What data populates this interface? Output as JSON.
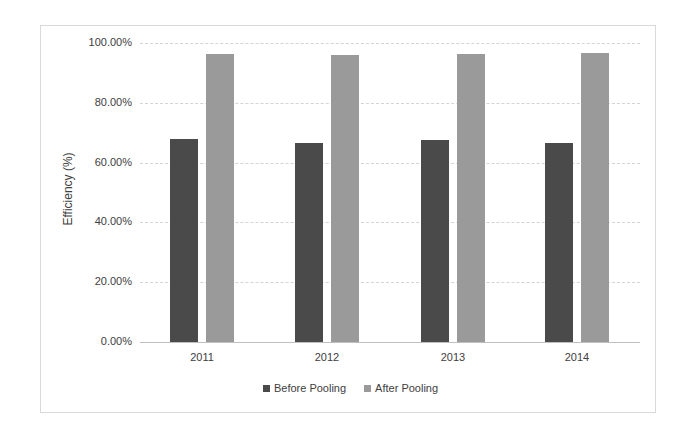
{
  "chart_data": {
    "type": "bar",
    "title": "",
    "xlabel": "",
    "ylabel": "Efficiency (%)",
    "ylim": [
      0,
      100
    ],
    "yticks": [
      "0.00%",
      "20.00%",
      "40.00%",
      "60.00%",
      "80.00%",
      "100.00%"
    ],
    "categories": [
      "2011",
      "2012",
      "2013",
      "2014"
    ],
    "series": [
      {
        "name": "Before Pooling",
        "color": "#4a4a4a",
        "values": [
          68.0,
          66.4,
          67.7,
          66.4
        ]
      },
      {
        "name": "After Pooling",
        "color": "#9a9a9a",
        "values": [
          96.2,
          95.9,
          96.4,
          96.6
        ]
      }
    ],
    "grid": true,
    "legend_position": "bottom"
  },
  "legend": {
    "items": [
      {
        "label": "Before Pooling",
        "color": "#4a4a4a"
      },
      {
        "label": "After Pooling",
        "color": "#9a9a9a"
      }
    ]
  }
}
